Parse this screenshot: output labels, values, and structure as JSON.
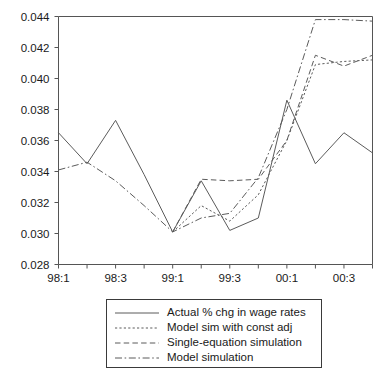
{
  "chart_data": {
    "type": "line",
    "title": "",
    "xlabel": "",
    "ylabel": "",
    "grid": false,
    "legend_position": "below-center",
    "x": [
      "98:1",
      "98:2",
      "98:3",
      "98:4",
      "99:1",
      "99:2",
      "99:3",
      "99:4",
      "00:1",
      "00:2",
      "00:3",
      "00:4"
    ],
    "xtick_labels": [
      "98:1",
      "98:3",
      "99:1",
      "99:3",
      "00:1",
      "00:3"
    ],
    "xtick_index": [
      0,
      2,
      4,
      6,
      8,
      10
    ],
    "ytick_labels": [
      "0.028",
      "0.030",
      "0.032",
      "0.034",
      "0.036",
      "0.038",
      "0.040",
      "0.042",
      "0.044"
    ],
    "ytick_values": [
      0.028,
      0.03,
      0.032,
      0.034,
      0.036,
      0.038,
      0.04,
      0.042,
      0.044
    ],
    "ylim": [
      0.028,
      0.044
    ],
    "series": [
      {
        "name": "Actual % chg in wage rates",
        "style": "solid",
        "values": [
          0.0365,
          0.0345,
          0.0373,
          0.0338,
          0.0301,
          0.0334,
          0.0302,
          0.031,
          0.0386,
          0.0345,
          0.0365,
          0.0352
        ]
      },
      {
        "name": "Model sim with const adj",
        "style": "dotted",
        "values": [
          null,
          null,
          null,
          null,
          0.0301,
          0.0318,
          0.0308,
          0.0325,
          0.036,
          0.0409,
          0.0411,
          0.0412
        ]
      },
      {
        "name": "Single-equation simulation",
        "style": "dashed",
        "values": [
          null,
          null,
          null,
          null,
          0.0301,
          0.0335,
          0.0334,
          0.0335,
          0.036,
          0.0415,
          0.0408,
          0.0415
        ]
      },
      {
        "name": "Model simulation",
        "style": "dashdot",
        "values": [
          0.0341,
          0.0346,
          0.0334,
          0.0318,
          0.0301,
          0.031,
          0.0313,
          0.0336,
          0.038,
          0.0438,
          0.0438,
          0.0437
        ]
      }
    ]
  },
  "legend": {
    "items": [
      {
        "label": "Actual % chg in wage rates",
        "style": "solid"
      },
      {
        "label": "Model sim with const adj",
        "style": "dotted"
      },
      {
        "label": "Single-equation simulation",
        "style": "dashed"
      },
      {
        "label": "Model simulation",
        "style": "dashdot"
      }
    ]
  },
  "colors": {
    "line": "#5b5b5b",
    "axis": "#555555",
    "text": "#1a1a1a",
    "background": "#ffffff"
  }
}
